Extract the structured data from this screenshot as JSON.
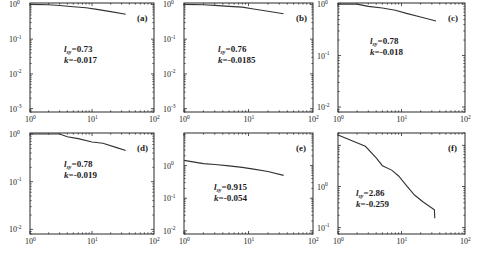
{
  "figure": {
    "width": 478,
    "height": 258,
    "line_color": "#333333",
    "frame_color": "#2a2a2a"
  },
  "chart_data": [
    {
      "type": "line",
      "panel": "(a)",
      "scale": "log-log",
      "frame": {
        "x0": 30,
        "x1": 154,
        "y0": 3,
        "y1": 112
      },
      "xlim": [
        1,
        100
      ],
      "ylim": [
        0.0008,
        1.1
      ],
      "xticks": [
        {
          "base": "10",
          "exp": "0",
          "v": 1
        },
        {
          "base": "10",
          "exp": "1",
          "v": 10
        },
        {
          "base": "10",
          "exp": "2",
          "v": 100
        }
      ],
      "yticks": [
        {
          "base": "10",
          "exp": "0",
          "v": 1
        },
        {
          "base": "10",
          "exp": "-1",
          "v": 0.1
        },
        {
          "base": "10",
          "exp": "-2",
          "v": 0.01
        },
        {
          "base": "10",
          "exp": "-3",
          "v": 0.001
        }
      ],
      "annotation": {
        "l_label": "l",
        "l_sub": "sy",
        "l_value": "=0.73",
        "k_label": "k",
        "k_value": "=-0.017"
      },
      "annot_pos": [
        64,
        52
      ],
      "x": [
        1,
        2,
        3,
        5,
        8,
        12,
        20,
        35
      ],
      "y": [
        1.0,
        0.98,
        0.93,
        0.86,
        0.8,
        0.72,
        0.62,
        0.52
      ]
    },
    {
      "type": "line",
      "panel": "(b)",
      "scale": "log-log",
      "frame": {
        "x0": 184,
        "x1": 313,
        "y0": 3,
        "y1": 112
      },
      "xlim": [
        1,
        100
      ],
      "ylim": [
        0.0008,
        1.1
      ],
      "xticks": [
        {
          "base": "10",
          "exp": "0",
          "v": 1
        },
        {
          "base": "10",
          "exp": "1",
          "v": 10
        },
        {
          "base": "10",
          "exp": "2",
          "v": 100
        }
      ],
      "yticks": [
        {
          "base": "10",
          "exp": "0",
          "v": 1
        },
        {
          "base": "10",
          "exp": "-1",
          "v": 0.1
        },
        {
          "base": "10",
          "exp": "-2",
          "v": 0.01
        },
        {
          "base": "10",
          "exp": "-3",
          "v": 0.001
        }
      ],
      "annotation": {
        "l_label": "l",
        "l_sub": "sy",
        "l_value": "=0.76",
        "k_label": "k",
        "k_value": "=-0.0185"
      },
      "annot_pos": [
        218,
        52
      ],
      "x": [
        1,
        2,
        3,
        5,
        8,
        12,
        20,
        35
      ],
      "y": [
        1.0,
        0.98,
        0.94,
        0.88,
        0.84,
        0.74,
        0.64,
        0.54
      ]
    },
    {
      "type": "line",
      "panel": "(c)",
      "scale": "log-log",
      "frame": {
        "x0": 338,
        "x1": 465,
        "y0": 3,
        "y1": 112
      },
      "xlim": [
        1,
        100
      ],
      "ylim": [
        0.008,
        1.05
      ],
      "xticks": [
        {
          "base": "10",
          "exp": "0",
          "v": 1
        },
        {
          "base": "10",
          "exp": "1",
          "v": 10
        },
        {
          "base": "10",
          "exp": "2",
          "v": 100
        }
      ],
      "yticks": [
        {
          "base": "10",
          "exp": "0",
          "v": 1
        },
        {
          "base": "10",
          "exp": "-1",
          "v": 0.1
        },
        {
          "base": "10",
          "exp": "-2",
          "v": 0.01
        }
      ],
      "annotation": {
        "l_label": "l",
        "l_sub": "sy",
        "l_value": "=0.78",
        "k_label": "k",
        "k_value": "=-0.018"
      },
      "annot_pos": [
        370,
        44
      ],
      "x": [
        1,
        2,
        3,
        5,
        8,
        12,
        20,
        35
      ],
      "y": [
        1.0,
        1.0,
        0.9,
        0.84,
        0.76,
        0.66,
        0.56,
        0.47
      ]
    },
    {
      "type": "line",
      "panel": "(d)",
      "scale": "log-log",
      "frame": {
        "x0": 30,
        "x1": 154,
        "y0": 133,
        "y1": 234
      },
      "xlim": [
        1,
        100
      ],
      "ylim": [
        0.008,
        1.05
      ],
      "xticks": [
        {
          "base": "10",
          "exp": "0",
          "v": 1
        },
        {
          "base": "10",
          "exp": "1",
          "v": 10
        },
        {
          "base": "10",
          "exp": "2",
          "v": 100
        }
      ],
      "yticks": [
        {
          "base": "10",
          "exp": "0",
          "v": 1
        },
        {
          "base": "10",
          "exp": "-1",
          "v": 0.1
        },
        {
          "base": "10",
          "exp": "-2",
          "v": 0.01
        }
      ],
      "annotation": {
        "l_label": "l",
        "l_sub": "sy",
        "l_value": "=0.78",
        "k_label": "k",
        "k_value": "=-0.019"
      },
      "annot_pos": [
        64,
        167
      ],
      "x": [
        1,
        3,
        4,
        6,
        10,
        15,
        25,
        35
      ],
      "y": [
        1.0,
        1.0,
        0.88,
        0.8,
        0.68,
        0.64,
        0.52,
        0.45
      ]
    },
    {
      "type": "line",
      "panel": "(e)",
      "scale": "log-log",
      "frame": {
        "x0": 184,
        "x1": 313,
        "y0": 133,
        "y1": 234
      },
      "xlim": [
        1,
        100
      ],
      "ylim": [
        0.008,
        10
      ],
      "xticks": [
        {
          "base": "10",
          "exp": "0",
          "v": 1
        },
        {
          "base": "10",
          "exp": "1",
          "v": 10
        },
        {
          "base": "10",
          "exp": "2",
          "v": 100
        }
      ],
      "yticks": [
        {
          "base": "10",
          "exp": "0",
          "v": 1
        },
        {
          "base": "10",
          "exp": "-1",
          "v": 0.1
        },
        {
          "base": "10",
          "exp": "-2",
          "v": 0.01
        }
      ],
      "annotation": {
        "l_label": "l",
        "l_sub": "sy",
        "l_value": "=0.915",
        "k_label": "k",
        "k_value": "=-0.054"
      },
      "annot_pos": [
        214,
        190
      ],
      "x": [
        1,
        2,
        3,
        5,
        8,
        12,
        20,
        35
      ],
      "y": [
        1.45,
        1.15,
        1.08,
        0.98,
        0.88,
        0.78,
        0.66,
        0.5
      ]
    },
    {
      "type": "line",
      "panel": "(f)",
      "scale": "log-log",
      "frame": {
        "x0": 338,
        "x1": 465,
        "y0": 133,
        "y1": 234
      },
      "xlim": [
        1,
        100
      ],
      "ylim": [
        0.07,
        20
      ],
      "xticks": [
        {
          "base": "10",
          "exp": "0",
          "v": 1
        },
        {
          "base": "10",
          "exp": "1",
          "v": 10
        },
        {
          "base": "10",
          "exp": "2",
          "v": 100
        }
      ],
      "yticks": [
        {
          "base": "10",
          "exp": "0",
          "v": 1
        },
        {
          "base": "10",
          "exp": "-1",
          "v": 0.1
        }
      ],
      "annotation": {
        "l_label": "l",
        "l_sub": "sy",
        "l_value": "=2.86",
        "k_label": "k",
        "k_value": "=-0.259"
      },
      "annot_pos": [
        356,
        196
      ],
      "x": [
        1,
        2.7,
        4,
        5,
        7,
        9,
        12,
        16,
        22,
        30,
        33,
        33.5
      ],
      "y": [
        18,
        9.5,
        5,
        3.2,
        2.5,
        1.8,
        1.05,
        0.62,
        0.42,
        0.3,
        0.27,
        0.17
      ]
    }
  ]
}
